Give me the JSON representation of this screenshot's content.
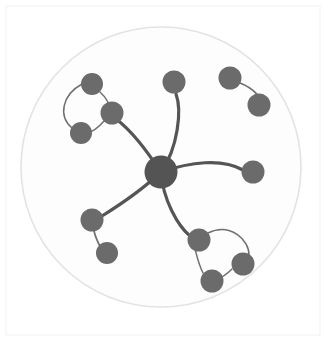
{
  "figure": {
    "title": "",
    "width": 326,
    "height": 341,
    "background_color": "#ffffff",
    "panel_border_color": "#f2f2f2",
    "panel": {
      "x": 6,
      "y": 6,
      "width": 314,
      "height": 329
    }
  },
  "boundary_circle": {
    "name": "outer-boundary-circle",
    "cx": 161,
    "cy": 167,
    "r": 140,
    "stroke_color": "#e3e3e3",
    "stroke_width": 1.6,
    "fill_color": "#fdfdfd"
  },
  "style": {
    "hub_node_color": "#545454",
    "leaf_node_color": "#6b6b6b",
    "ring_node_color": "#6b6b6b",
    "hub_edge_color": "#555555",
    "ring_edge_color": "#6f6f6f",
    "hub_edge_width": 3.2,
    "branch_edge_width": 1.7,
    "ring_edge_width": 1.5,
    "node_stroke_color": "none"
  },
  "chart_data": {
    "type": "scatter",
    "title": "",
    "xlabel": "",
    "ylabel": "",
    "grid": false,
    "legend": "none",
    "xlim": [
      0,
      326
    ],
    "ylim": [
      0,
      341
    ],
    "counts": {
      "total_nodes": 13,
      "hub_nodes": 1,
      "peripheral_nodes": 12,
      "total_edges": 13,
      "hub_spokes": 5,
      "clusters": 5
    },
    "nodes": [
      {
        "id": "hub",
        "label": "hub",
        "x": 161,
        "y": 172,
        "r": 16.5,
        "role": "hub",
        "color": "#545454"
      },
      {
        "id": "n1",
        "label": "n1",
        "x": 92,
        "y": 84,
        "r": 11.0,
        "role": "ring",
        "color": "#6b6b6b"
      },
      {
        "id": "n2",
        "label": "n2",
        "x": 112,
        "y": 113,
        "r": 11.5,
        "role": "ring-anchor",
        "color": "#6b6b6b"
      },
      {
        "id": "n3",
        "label": "n3",
        "x": 81,
        "y": 133,
        "r": 11.0,
        "role": "ring",
        "color": "#6b6b6b"
      },
      {
        "id": "n4",
        "label": "n4",
        "x": 174,
        "y": 82,
        "r": 11.5,
        "role": "leaf",
        "color": "#6b6b6b"
      },
      {
        "id": "n5",
        "label": "n5",
        "x": 253,
        "y": 172,
        "r": 11.5,
        "role": "leaf",
        "color": "#6b6b6b"
      },
      {
        "id": "n6",
        "label": "n6",
        "x": 92,
        "y": 220,
        "r": 11.5,
        "role": "chain",
        "color": "#6b6b6b"
      },
      {
        "id": "n7",
        "label": "n7",
        "x": 107,
        "y": 253,
        "r": 11.0,
        "role": "chain-leaf",
        "color": "#6b6b6b"
      },
      {
        "id": "n8",
        "label": "n8",
        "x": 199,
        "y": 240,
        "r": 11.5,
        "role": "ring-anchor",
        "color": "#6b6b6b"
      },
      {
        "id": "n9",
        "label": "n9",
        "x": 243,
        "y": 264,
        "r": 11.5,
        "role": "ring",
        "color": "#6b6b6b"
      },
      {
        "id": "n10",
        "label": "n10",
        "x": 212,
        "y": 281,
        "r": 11.5,
        "role": "ring",
        "color": "#6b6b6b"
      },
      {
        "id": "n11",
        "label": "n11",
        "x": 230,
        "y": 78,
        "r": 11.5,
        "role": "isolated",
        "color": "#6b6b6b"
      },
      {
        "id": "n12",
        "label": "n12",
        "x": 259,
        "y": 105,
        "r": 11.5,
        "role": "isolated",
        "color": "#6b6b6b"
      }
    ],
    "edges": [
      {
        "source": "hub",
        "target": "n2",
        "kind": "spoke",
        "curve": "arc",
        "path": "M 161 172 C 146 150 133 132 115 118"
      },
      {
        "source": "hub",
        "target": "n4",
        "kind": "spoke",
        "curve": "arc",
        "path": "M 161 172 C 178 148 182 110 176 94"
      },
      {
        "source": "hub",
        "target": "n5",
        "kind": "spoke",
        "curve": "arc",
        "path": "M 161 172 C 190 162 222 158 243 170"
      },
      {
        "source": "hub",
        "target": "n6",
        "kind": "spoke",
        "curve": "arc",
        "path": "M 161 172 C 140 192 118 206 102 216"
      },
      {
        "source": "hub",
        "target": "n8",
        "kind": "spoke",
        "curve": "arc",
        "path": "M 161 172 C 163 200 178 226 190 236"
      },
      {
        "source": "n1",
        "target": "n2",
        "kind": "ring",
        "curve": "arc",
        "path": "M 100 92 C 108 99 110 105 110 112"
      },
      {
        "source": "n2",
        "target": "n3",
        "kind": "ring",
        "curve": "arc",
        "path": "M 104 121 C 98 128 92 132 87 133"
      },
      {
        "source": "n3",
        "target": "n1",
        "kind": "ring",
        "curve": "arc",
        "path": "M 72 128 C 58 116 62 95 82 84"
      },
      {
        "source": "n6",
        "target": "n7",
        "kind": "branch",
        "curve": "arc",
        "path": "M 94 231 C 96 240 100 246 102 250"
      },
      {
        "source": "n8",
        "target": "n9",
        "kind": "ring",
        "curve": "arc",
        "path": "M 208 233 C 230 222 250 240 249 256"
      },
      {
        "source": "n9",
        "target": "n10",
        "kind": "ring",
        "curve": "arc",
        "path": "M 232 269 C 227 274 221 278 216 280"
      },
      {
        "source": "n10",
        "target": "n8",
        "kind": "ring",
        "curve": "arc",
        "path": "M 203 273 C 198 263 196 252 195 249"
      },
      {
        "source": "n11",
        "target": "n12",
        "kind": "branch",
        "curve": "arc",
        "path": "M 240 83 C 253 88 257 95 257 94"
      }
    ]
  }
}
